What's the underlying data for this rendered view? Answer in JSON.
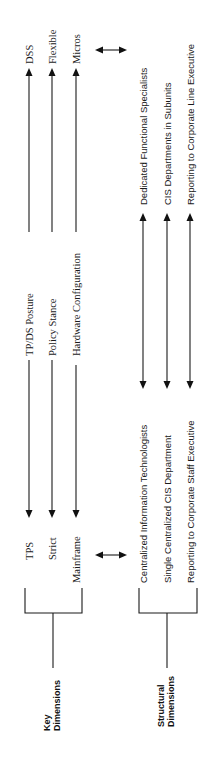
{
  "diagram": {
    "orientation": "rotated-90-ccw",
    "colors": {
      "ink": "#1a1a1a",
      "background": "#ffffff"
    },
    "key_dimensions": {
      "label_line1": "Key",
      "label_line2": "Dimensions",
      "rows": [
        {
          "left": "TPS",
          "middle": "TP/DS Posture",
          "right": "DSS"
        },
        {
          "left": "Strict",
          "middle": "Policy Stance",
          "right": "Flexible"
        },
        {
          "left": "Mainframe",
          "middle": "Hardware Configuration",
          "right": "Micros"
        }
      ]
    },
    "structural_dimensions": {
      "label_line1": "Structural",
      "label_line2": "Dimensions",
      "rows": [
        {
          "left": "Centralized Information Technologists",
          "right": "Dedicated Functional Specialists"
        },
        {
          "left": "Single Centralized CIS Department",
          "right": "CIS Departments in Subunits"
        },
        {
          "left": "Reporting to Corporate Staff Executive",
          "right": "Reporting to Corporate Line Executive"
        }
      ]
    },
    "connectors": [
      {
        "type": "double-arrow",
        "between": "key-left-and-structural-left"
      },
      {
        "type": "double-arrow",
        "between": "key-right-and-structural-right"
      }
    ]
  }
}
